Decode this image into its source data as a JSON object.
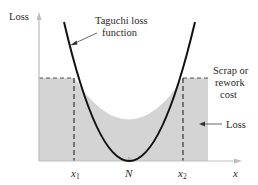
{
  "diagram": {
    "y_axis_label": "Loss",
    "x_axis_label": "x",
    "curve_label_line1": "Taguchi loss",
    "curve_label_line2": "function",
    "step_label_line1": "Scrap or",
    "step_label_line2": "rework",
    "step_label_line3": "cost",
    "region_label": "Loss",
    "ticks": {
      "x1_main": "x",
      "x1_sub": "1",
      "nominal": "N",
      "x2_main": "x",
      "x2_sub": "2"
    },
    "colors": {
      "shaded_region": "#d4d4d4",
      "curve": "#111111",
      "axis": "#bdbdbd",
      "dashed": "#333333",
      "text": "#2a2a2a"
    }
  }
}
